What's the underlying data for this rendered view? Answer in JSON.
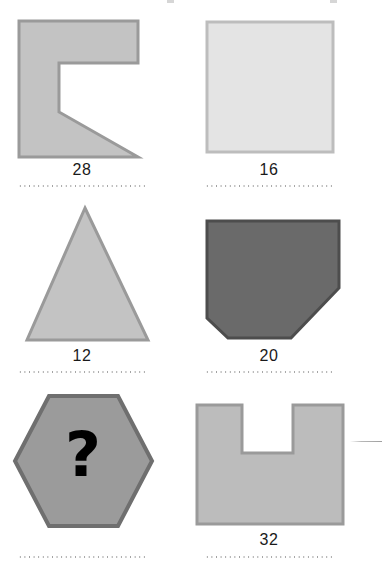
{
  "page": {
    "background": "#ffffff",
    "width": 382,
    "height": 577
  },
  "palette": {
    "medium_gray_fill": "#c3c3c3",
    "medium_gray_stroke": "#9a9a9a",
    "light_gray_fill": "#e4e4e4",
    "light_gray_stroke": "#bdbdbd",
    "dark_gray_fill": "#6a6a6a",
    "dark_gray_stroke": "#4d4d4d",
    "label_color": "#1a1a1a",
    "dotted_rule_color": "#9a9a9a",
    "question_mark_color": "#000000"
  },
  "grid": {
    "columns": 2,
    "rows": 3
  },
  "items": [
    {
      "id": "shape-1",
      "name": "c-bracket-polygon",
      "row": 0,
      "column": 0,
      "label": "28",
      "has_label": true,
      "has_dotted_rule": true,
      "fill": "#c3c3c3",
      "stroke": "#9a9a9a",
      "points": "19,21 138,21 138,63 59,63 59,112 138,157 19,157"
    },
    {
      "id": "shape-2",
      "name": "square",
      "row": 0,
      "column": 1,
      "label": "16",
      "has_label": true,
      "has_dotted_rule": true,
      "fill": "#e4e4e4",
      "stroke": "#bdbdbd",
      "points": "207,22 333,22 333,152 207,152"
    },
    {
      "id": "shape-3",
      "name": "triangle",
      "row": 1,
      "column": 0,
      "label": "12",
      "has_label": true,
      "has_dotted_rule": true,
      "fill": "#c3c3c3",
      "stroke": "#9a9a9a",
      "points": "85,208 148,340 27,340"
    },
    {
      "id": "shape-4",
      "name": "cut-corner-pentagon",
      "row": 1,
      "column": 1,
      "label": "20",
      "has_label": true,
      "has_dotted_rule": true,
      "fill": "#6a6a6a",
      "stroke": "#4d4d4d",
      "points": "207,221 339,221 339,288 291,338 228,338 207,318"
    },
    {
      "id": "shape-5",
      "name": "hexagon-with-question-mark",
      "row": 2,
      "column": 0,
      "label": "",
      "has_label": false,
      "has_dotted_rule": true,
      "fill": "#9b9b9b",
      "stroke": "#6f6f6f",
      "points": "49,396 118,396 152,461 118,526 49,526 15,461",
      "overlay_glyph": "?",
      "overlay_glyph_name": "question-mark"
    },
    {
      "id": "shape-6",
      "name": "u-notched-square",
      "row": 2,
      "column": 1,
      "label": "32",
      "has_label": true,
      "has_dotted_rule": true,
      "fill": "#bcbcbc",
      "stroke": "#9a9a9a",
      "points": "197,405 242,405 242,453 293,453 293,405 343,405 343,524 197,524"
    }
  ],
  "answer_lines": [
    {
      "id": "rule-1",
      "for": "shape-1",
      "x": 18,
      "y": 185,
      "width": 128
    },
    {
      "id": "rule-2",
      "for": "shape-2",
      "x": 205,
      "y": 185,
      "width": 128
    },
    {
      "id": "rule-3",
      "for": "shape-3",
      "x": 18,
      "y": 371,
      "width": 128
    },
    {
      "id": "rule-4",
      "for": "shape-4",
      "x": 205,
      "y": 371,
      "width": 128
    },
    {
      "id": "rule-5",
      "for": "shape-5",
      "x": 18,
      "y": 556,
      "width": 128
    },
    {
      "id": "rule-6",
      "for": "shape-6",
      "x": 205,
      "y": 556,
      "width": 128
    }
  ],
  "decorations": {
    "right_edge_tick": {
      "x": 350,
      "y": 441,
      "width": 32
    },
    "crop_marks": [
      {
        "x": 167,
        "y": 0,
        "width": 7,
        "height": 3
      },
      {
        "x": 330,
        "y": 0,
        "width": 7,
        "height": 3
      }
    ]
  }
}
